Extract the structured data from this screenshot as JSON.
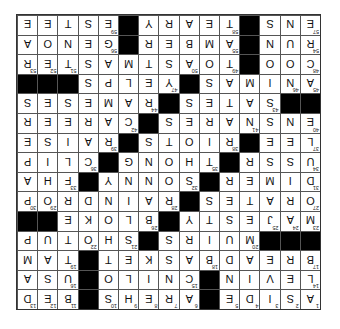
{
  "puzzle": {
    "size": 15,
    "rotation_degrees": 180,
    "colors": {
      "block": "#000000",
      "cell": "#ffffff",
      "grid_line": "#555555",
      "letter": "#111111"
    },
    "rows": [
      "ASIDE#AREHS#BED",
      "LEVIN#CNILO#USA",
      "BREADBASKET#TAM",
      "###MUIRS#SHOTUP",
      "MAJESTY#BLOKE##",
      "ORATES#RAINDROP",
      "DIMER#SONNY#FHA",
      "USSR#THONG#CLIP",
      "LEE#RIOTS#RAISE",
      "ENSNARES#CAREER",
      "##SATES#RAMESES",
      "ANIMAS#YELPS###",
      "COO#TOASTMASTER",
      "RUN#AMBER#GENOA",
      "ENS#TEARY#ESTEE"
    ]
  }
}
